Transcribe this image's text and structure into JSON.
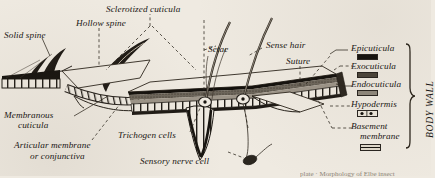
{
  "figure": {
    "title_visible": false,
    "background_color": "#efeae1",
    "ink_color": "#1a1714"
  },
  "labels": {
    "solid_spine": "Solid spine",
    "hollow_spine": "Hollow spine",
    "sclerotized_cuticula": "Sclerotized cuticula",
    "setae": "Setae",
    "sense_hair": "Sense hair",
    "suture": "Suture",
    "membranous_cuticula_l1": "Membranous",
    "membranous_cuticula_l2": "cuticula",
    "articular_l1": "Articular membrane",
    "articular_l2": "or conjunctiva",
    "trichogen_cells": "Trichogen cells",
    "sensory_nerve_cell": "Sensory nerve cell"
  },
  "layers": {
    "bracket_label": "BODY WALL",
    "items": [
      {
        "name": "Epicuticula",
        "swatch": "solid-black",
        "color": "#17140f"
      },
      {
        "name": "Exocuticula",
        "swatch": "dark-stipple",
        "color": "#4b443a"
      },
      {
        "name": "Endocuticula",
        "swatch": "grey-stipple",
        "color": "#8d867a"
      },
      {
        "name": "Hypodermis",
        "swatch": "cells-nuclei",
        "color": "#e8e2d6"
      },
      {
        "name": "Basement",
        "swatch": "thin-line",
        "color": "#ddd6c8"
      }
    ],
    "basement_second_line": "membrane"
  },
  "footer": {
    "cropped_caption": "plate · Morphology of Elbe insect"
  }
}
